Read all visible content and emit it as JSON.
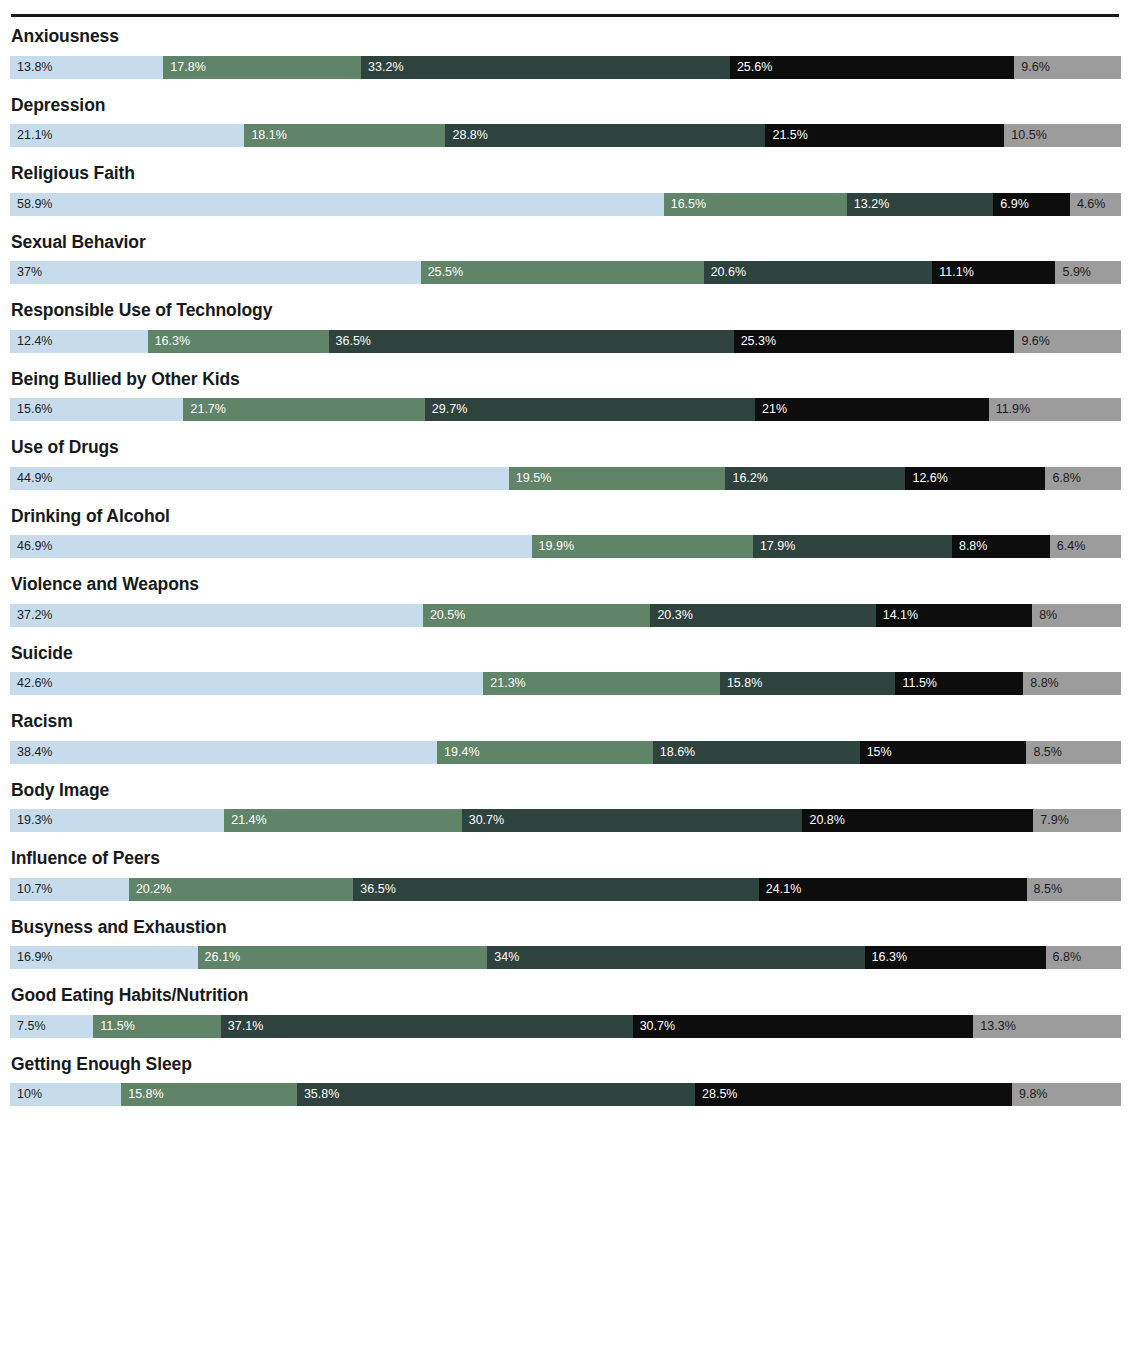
{
  "chart_data": {
    "type": "bar",
    "title": "",
    "subtitle": "",
    "xlabel": "",
    "ylabel": "",
    "orientation": "horizontal",
    "stacked": true,
    "normalized_percent": true,
    "grid": false,
    "legend_position": "none",
    "xlim": [
      0,
      100
    ],
    "series": [
      {
        "name": "Segment 1",
        "color": "#c6dced"
      },
      {
        "name": "Segment 2",
        "color": "#5f8468"
      },
      {
        "name": "Segment 3",
        "color": "#2e423e"
      },
      {
        "name": "Segment 4",
        "color": "#0d0d0d"
      },
      {
        "name": "Segment 5",
        "color": "#9c9c9c"
      }
    ],
    "categories": [
      "Anxiousness",
      "Depression",
      "Religious Faith",
      "Sexual Behavior",
      "Responsible Use of Technology",
      "Being Bullied by Other Kids",
      "Use of Drugs",
      "Drinking of Alcohol",
      "Violence and Weapons",
      "Suicide",
      "Racism",
      "Body Image",
      "Influence of Peers",
      "Busyness and Exhaustion",
      "Good Eating Habits/Nutrition",
      "Getting Enough Sleep"
    ],
    "rows": [
      {
        "label": "Anxiousness",
        "values": [
          13.8,
          17.8,
          33.2,
          25.6,
          9.6
        ],
        "labels": [
          "13.8%",
          "17.8%",
          "33.2%",
          "25.6%",
          "9.6%"
        ]
      },
      {
        "label": "Depression",
        "values": [
          21.1,
          18.1,
          28.8,
          21.5,
          10.5
        ],
        "labels": [
          "21.1%",
          "18.1%",
          "28.8%",
          "21.5%",
          "10.5%"
        ]
      },
      {
        "label": "Religious Faith",
        "values": [
          58.9,
          16.5,
          13.2,
          6.9,
          4.6
        ],
        "labels": [
          "58.9%",
          "16.5%",
          "13.2%",
          "6.9%",
          "4.6%"
        ]
      },
      {
        "label": "Sexual Behavior",
        "values": [
          37,
          25.5,
          20.6,
          11.1,
          5.9
        ],
        "labels": [
          "37%",
          "25.5%",
          "20.6%",
          "11.1%",
          "5.9%"
        ]
      },
      {
        "label": "Responsible Use of Technology",
        "values": [
          12.4,
          16.3,
          36.5,
          25.3,
          9.6
        ],
        "labels": [
          "12.4%",
          "16.3%",
          "36.5%",
          "25.3%",
          "9.6%"
        ]
      },
      {
        "label": "Being Bullied by Other Kids",
        "values": [
          15.6,
          21.7,
          29.7,
          21,
          11.9
        ],
        "labels": [
          "15.6%",
          "21.7%",
          "29.7%",
          "21%",
          "11.9%"
        ]
      },
      {
        "label": "Use of Drugs",
        "values": [
          44.9,
          19.5,
          16.2,
          12.6,
          6.8
        ],
        "labels": [
          "44.9%",
          "19.5%",
          "16.2%",
          "12.6%",
          "6.8%"
        ]
      },
      {
        "label": "Drinking of Alcohol",
        "values": [
          46.9,
          19.9,
          17.9,
          8.8,
          6.4
        ],
        "labels": [
          "46.9%",
          "19.9%",
          "17.9%",
          "8.8%",
          "6.4%"
        ]
      },
      {
        "label": "Violence and Weapons",
        "values": [
          37.2,
          20.5,
          20.3,
          14.1,
          8
        ],
        "labels": [
          "37.2%",
          "20.5%",
          "20.3%",
          "14.1%",
          "8%"
        ]
      },
      {
        "label": "Suicide",
        "values": [
          42.6,
          21.3,
          15.8,
          11.5,
          8.8
        ],
        "labels": [
          "42.6%",
          "21.3%",
          "15.8%",
          "11.5%",
          "8.8%"
        ]
      },
      {
        "label": "Racism",
        "values": [
          38.4,
          19.4,
          18.6,
          15,
          8.5
        ],
        "labels": [
          "38.4%",
          "19.4%",
          "18.6%",
          "15%",
          "8.5%"
        ]
      },
      {
        "label": "Body Image",
        "values": [
          19.3,
          21.4,
          30.7,
          20.8,
          7.9
        ],
        "labels": [
          "19.3%",
          "21.4%",
          "30.7%",
          "20.8%",
          "7.9%"
        ]
      },
      {
        "label": "Influence of Peers",
        "values": [
          10.7,
          20.2,
          36.5,
          24.1,
          8.5
        ],
        "labels": [
          "10.7%",
          "20.2%",
          "36.5%",
          "24.1%",
          "8.5%"
        ]
      },
      {
        "label": "Busyness and Exhaustion",
        "values": [
          16.9,
          26.1,
          34,
          16.3,
          6.8
        ],
        "labels": [
          "16.9%",
          "26.1%",
          "34%",
          "16.3%",
          "6.8%"
        ]
      },
      {
        "label": "Good Eating Habits/Nutrition",
        "values": [
          7.5,
          11.5,
          37.1,
          30.7,
          13.3
        ],
        "labels": [
          "7.5%",
          "11.5%",
          "37.1%",
          "30.7%",
          "13.3%"
        ]
      },
      {
        "label": "Getting Enough Sleep",
        "values": [
          10,
          15.8,
          35.8,
          28.5,
          9.8
        ],
        "labels": [
          "10%",
          "15.8%",
          "35.8%",
          "28.5%",
          "9.8%"
        ]
      }
    ]
  }
}
